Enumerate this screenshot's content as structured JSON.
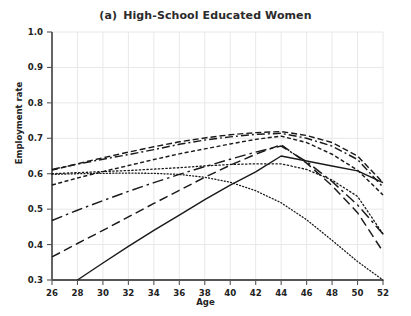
{
  "chart_data": {
    "type": "line",
    "panel_letter": "(a)",
    "title_text": "High-School Educated Women",
    "xlabel": "Age",
    "ylabel": "Employment rate",
    "xlim": [
      26,
      52
    ],
    "ylim": [
      0.3,
      1.0
    ],
    "xticks": [
      26,
      28,
      30,
      32,
      34,
      36,
      38,
      40,
      42,
      44,
      46,
      48,
      50,
      52
    ],
    "yticks": [
      0.3,
      0.4,
      0.5,
      0.6,
      0.7,
      0.8,
      0.9,
      1.0
    ],
    "ytick_labels": [
      "0.3",
      "0.4",
      "0.5",
      "0.6",
      "0.7",
      "0.8",
      "0.9",
      "1.0"
    ],
    "grid": true,
    "grid_color": "#e8e8e8",
    "legend": "none",
    "line_color": "#1a1a1a",
    "x": [
      26,
      28,
      30,
      32,
      34,
      36,
      38,
      40,
      42,
      44,
      46,
      48,
      50,
      52
    ],
    "series": [
      {
        "name": "cohort-1-dashed-upper",
        "style": "dashed",
        "values": [
          0.61,
          0.628,
          0.645,
          0.661,
          0.676,
          0.69,
          0.701,
          0.71,
          0.716,
          0.719,
          0.708,
          0.688,
          0.65,
          0.575
        ]
      },
      {
        "name": "cohort-2-dashdot-upper",
        "style": "dash-dot",
        "values": [
          0.612,
          0.627,
          0.641,
          0.654,
          0.668,
          0.683,
          0.695,
          0.704,
          0.711,
          0.714,
          0.7,
          0.678,
          0.64,
          0.562
        ]
      },
      {
        "name": "cohort-3-densely-dashed",
        "style": "densely-dashed",
        "values": [
          0.568,
          0.588,
          0.606,
          0.623,
          0.64,
          0.656,
          0.67,
          0.684,
          0.697,
          0.706,
          0.688,
          0.655,
          0.61,
          0.54
        ]
      },
      {
        "name": "cohort-4-solid",
        "style": "solid",
        "values": [
          null,
          0.3,
          0.348,
          0.395,
          0.44,
          0.483,
          0.527,
          0.568,
          0.605,
          0.65,
          0.636,
          0.622,
          0.608,
          0.575
        ]
      },
      {
        "name": "cohort-5-long-dashed",
        "style": "long-dashed",
        "values": [
          0.365,
          0.403,
          0.44,
          0.478,
          0.516,
          0.553,
          0.59,
          0.624,
          0.655,
          0.682,
          0.63,
          0.566,
          0.49,
          0.38
        ]
      },
      {
        "name": "cohort-6-dashdot-lower",
        "style": "dash-dot-long",
        "values": [
          0.468,
          0.497,
          0.524,
          0.55,
          0.575,
          0.598,
          0.62,
          0.641,
          0.661,
          0.678,
          0.634,
          0.578,
          0.512,
          0.43
        ]
      },
      {
        "name": "cohort-7-dotted",
        "style": "dotted",
        "values": [
          0.6,
          0.603,
          0.606,
          0.609,
          0.613,
          0.617,
          0.622,
          0.626,
          0.628,
          0.628,
          0.612,
          0.582,
          0.536,
          0.43
        ]
      },
      {
        "name": "cohort-8-fine-dotted",
        "style": "fine-dotted",
        "values": [
          0.598,
          0.6,
          0.601,
          0.602,
          0.601,
          0.598,
          0.59,
          0.576,
          0.552,
          0.518,
          0.47,
          0.412,
          0.352,
          0.3
        ]
      }
    ]
  }
}
